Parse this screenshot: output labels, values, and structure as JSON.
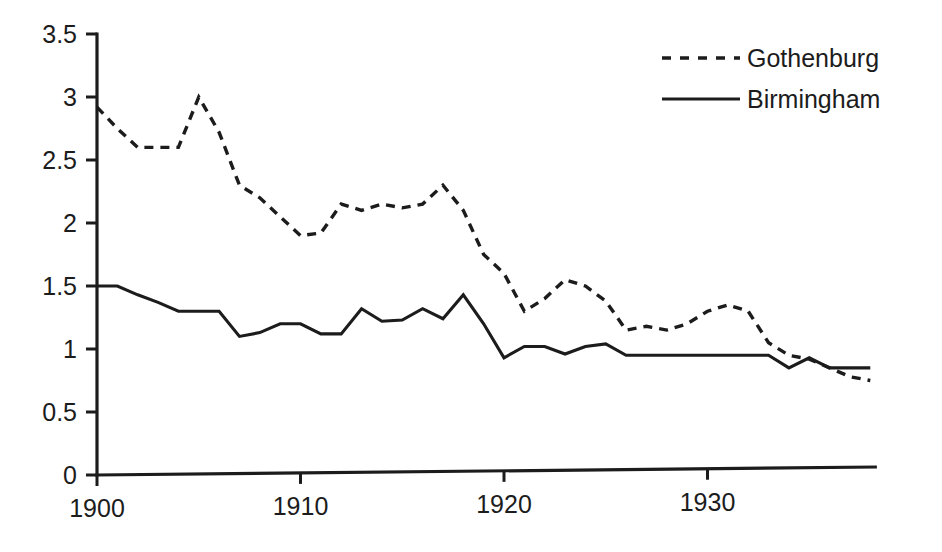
{
  "chart_data": {
    "type": "line",
    "title": "",
    "subtitle": "",
    "xlabel": "",
    "ylabel": "",
    "xlim": [
      1900,
      1938
    ],
    "ylim": [
      0,
      3.5
    ],
    "grid": false,
    "legend_position": "top-right",
    "x_tick_labels": [
      "1900",
      "1910",
      "1920",
      "1930"
    ],
    "x_ticks": [
      1900,
      1910,
      1920,
      1930
    ],
    "y_tick_labels": [
      "0",
      "0.5",
      "1",
      "1.5",
      "2",
      "2.5",
      "3",
      "3.5"
    ],
    "y_ticks": [
      0,
      0.5,
      1,
      1.5,
      2,
      2.5,
      3,
      3.5
    ],
    "x": [
      1900,
      1901,
      1902,
      1903,
      1904,
      1905,
      1906,
      1907,
      1908,
      1909,
      1910,
      1911,
      1912,
      1913,
      1914,
      1915,
      1916,
      1917,
      1918,
      1919,
      1920,
      1921,
      1922,
      1923,
      1924,
      1925,
      1926,
      1927,
      1928,
      1929,
      1930,
      1931,
      1932,
      1933,
      1934,
      1935,
      1936,
      1937,
      1938
    ],
    "series": [
      {
        "name": "Gothenburg",
        "style": "dashed",
        "color": "#1c1c1c",
        "values": [
          2.92,
          2.75,
          2.6,
          2.6,
          2.6,
          3.0,
          2.72,
          2.3,
          2.2,
          2.05,
          1.9,
          1.92,
          2.15,
          2.1,
          2.15,
          2.12,
          2.15,
          2.3,
          2.1,
          1.75,
          1.6,
          1.3,
          1.4,
          1.55,
          1.5,
          1.38,
          1.15,
          1.18,
          1.15,
          1.2,
          1.3,
          1.35,
          1.3,
          1.05,
          0.95,
          0.92,
          0.85,
          0.78,
          0.75
        ]
      },
      {
        "name": "Birmingham",
        "style": "solid",
        "color": "#1c1c1c",
        "values": [
          1.5,
          1.5,
          1.43,
          1.37,
          1.3,
          1.3,
          1.3,
          1.1,
          1.13,
          1.2,
          1.2,
          1.12,
          1.12,
          1.32,
          1.22,
          1.23,
          1.32,
          1.24,
          1.43,
          1.2,
          0.93,
          1.02,
          1.02,
          0.96,
          1.02,
          1.04,
          0.95,
          0.95,
          0.95,
          0.95,
          0.95,
          0.95,
          0.95,
          0.95,
          0.85,
          0.93,
          0.85,
          0.85,
          0.85
        ]
      }
    ]
  },
  "legend": {
    "entries": [
      {
        "label": "Gothenburg",
        "style": "dashed"
      },
      {
        "label": "Birmingham",
        "style": "solid"
      }
    ]
  },
  "axes": {
    "y_axis_name": "vertical-axis",
    "x_axis_name": "horizontal-axis"
  }
}
